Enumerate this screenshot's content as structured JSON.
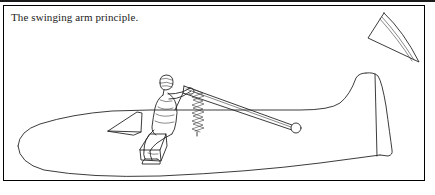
{
  "figure": {
    "caption": "The swinging arm principle.",
    "ink_color": "#262626",
    "background_color": "#ffffff",
    "frame_color": "#000000"
  },
  "scene": {
    "subject": "glider fuselage with seated pilot operating a swinging control arm",
    "parts": [
      {
        "name": "fuselage",
        "label": "fuselage"
      },
      {
        "name": "nose",
        "label": "nose"
      },
      {
        "name": "tail-fin",
        "label": "tail fin"
      },
      {
        "name": "rudder-hinge-line",
        "label": "rudder hinge line"
      },
      {
        "name": "wing-root-fairing",
        "label": "wing root fairing"
      },
      {
        "name": "pilot",
        "label": "pilot"
      },
      {
        "name": "seat-platform",
        "label": "seat platform"
      },
      {
        "name": "swinging-arm",
        "label": "swinging arm"
      },
      {
        "name": "pivot-point",
        "label": "pivot point"
      },
      {
        "name": "return-spring",
        "label": "return spring"
      },
      {
        "name": "detached-wing-panel",
        "label": "detached wing panel"
      }
    ]
  }
}
